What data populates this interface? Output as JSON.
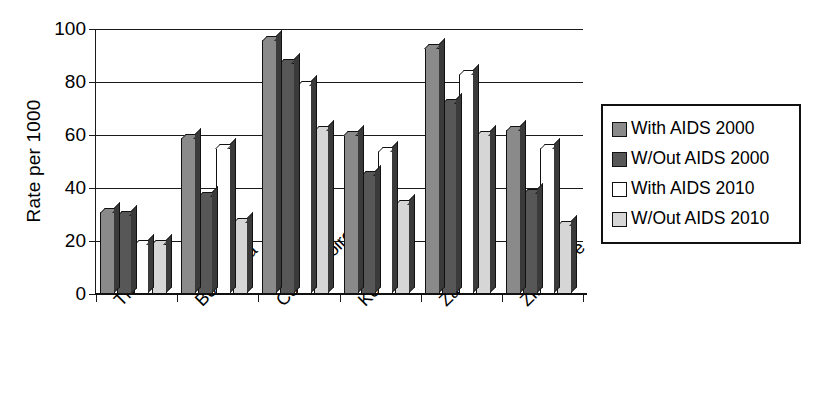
{
  "chart_data": {
    "type": "bar",
    "title": "",
    "xlabel": "",
    "ylabel": "Rate per 1000",
    "ylim": [
      0,
      100
    ],
    "yticks": [
      0,
      20,
      40,
      60,
      80,
      100
    ],
    "grid": true,
    "legend_position": "right",
    "categories": [
      "Thailand",
      "Botswana",
      "Cote d'Ivoire",
      "Kenya",
      "Zambia",
      "Zimbabwe"
    ],
    "series": [
      {
        "name": "With AIDS 2000",
        "color": "#8a8a8a",
        "values": [
          31,
          59,
          96,
          60,
          93,
          62
        ]
      },
      {
        "name": "W/Out AIDS 2000",
        "color": "#575757",
        "values": [
          30,
          37,
          87,
          45,
          72,
          38
        ]
      },
      {
        "name": "With AIDS 2010",
        "color": "#ffffff",
        "values": [
          19,
          55,
          79,
          54,
          83,
          55
        ]
      },
      {
        "name": "W/Out AIDS 2010",
        "color": "#d6d6d6",
        "values": [
          19,
          27,
          62,
          34,
          60,
          26
        ]
      }
    ]
  },
  "axis": {
    "y_title": "Rate per 1000",
    "y_tick_labels": [
      "100",
      "80",
      "60",
      "40",
      "20",
      "0"
    ]
  },
  "legend": {
    "items": [
      {
        "label": "With AIDS 2000",
        "color": "#8a8a8a"
      },
      {
        "label": "W/Out AIDS 2000",
        "color": "#575757"
      },
      {
        "label": "With AIDS 2010",
        "color": "#ffffff"
      },
      {
        "label": "W/Out AIDS 2010",
        "color": "#d6d6d6"
      }
    ]
  }
}
